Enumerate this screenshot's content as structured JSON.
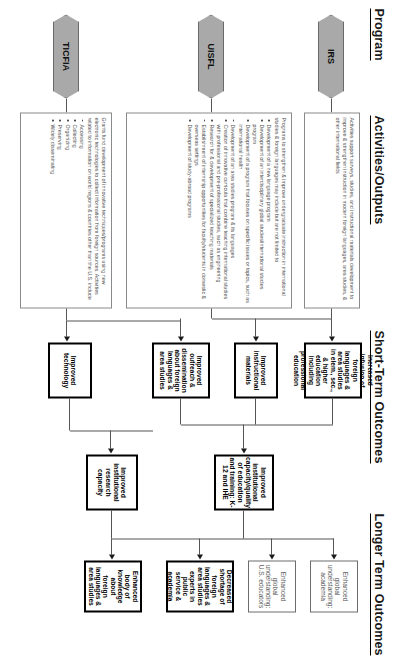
{
  "diagram": {
    "rotation_degrees": 90,
    "columns": [
      {
        "id": "program",
        "label": "Program"
      },
      {
        "id": "activities",
        "label": "Activities/Outputs"
      },
      {
        "id": "short_term",
        "label": "Short-Term Outcomes"
      },
      {
        "id": "long_term",
        "label": "Longer Term Outcomes"
      }
    ]
  },
  "programs": [
    {
      "id": "irs",
      "label": "IRS"
    },
    {
      "id": "uisfl",
      "label": "UISFL"
    },
    {
      "id": "ticfia",
      "label": "TICFIA"
    }
  ],
  "activities": [
    {
      "id": "irs-activities",
      "intro": "Activities support surveys, studies, and instructional materials development to improve & strengthen instruction in modern foreign languages, area studies, & other international fields",
      "bullets": []
    },
    {
      "id": "uisfl-activities",
      "intro": "Programs to strengthen & improve undergraduate instruction in international studies & foreign languages may include but are not limited to",
      "bullets": [
        "Development of a new language program",
        "Development of an interdisciplinary global studies/international studies program",
        "Development of a program that focuses on specific issues or topics, such as international health",
        "Development of an area studies program & its languages",
        "Creation of innovative curricula that combine teaching international studies with professional and pre-professional studies, such as engineering",
        "Research for & development of specialized teaching materials",
        "Establishment of internship opportunities for faculty/students in domestic & overseas settings",
        "Development of study-abroad programs"
      ]
    },
    {
      "id": "ticfia-activities",
      "intro": "Grants fund development of innovative techniques/programs using new electronic technologies to collect information from foreign sources. Activities related to information on world regions & countries other than the U.S. include",
      "bullets": [
        "Accessing",
        "Collecting",
        "Organizing",
        "Preserving",
        "Widely disseminating"
      ]
    }
  ],
  "short_term_outcomes": [
    {
      "id": "st-infusion",
      "label": "Increased infusion of foreign languages & area studies in elem., sec., & higher education including professional education",
      "emphasis": "bold"
    },
    {
      "id": "st-materials",
      "label": "Improved instructional materials",
      "emphasis": "bold"
    },
    {
      "id": "st-outreach",
      "label": "Improved outreach & dissemination about foreign languages & area studies",
      "emphasis": "bold"
    },
    {
      "id": "st-technology",
      "label": "Improved technology",
      "emphasis": "bold"
    }
  ],
  "intermediate_outcomes": [
    {
      "id": "mid-institutional-capacity",
      "label": "Improved institutional capacity/quality of education and training: K-12 and IHE",
      "emphasis": "bold"
    },
    {
      "id": "mid-research-capacity",
      "label": "Improved institutional research capacity",
      "emphasis": "bold"
    }
  ],
  "long_term_outcomes": [
    {
      "id": "lt-global-academia",
      "label": "Enhanced global understanding: academia",
      "emphasis": "thin"
    },
    {
      "id": "lt-global-educators",
      "label": "Enhanced global understanding: U.S. educators",
      "emphasis": "thin"
    },
    {
      "id": "lt-shortage",
      "label": "Decreased shortage of foreign languages & area studies experts in public service & academia",
      "emphasis": "bold"
    },
    {
      "id": "lt-knowledge-body",
      "label": "Enhanced body of knowledge about foreign languages & area studies",
      "emphasis": "bold"
    }
  ],
  "colors": {
    "chevron_fill": "#a9a9a9",
    "bold_border": "#000000",
    "thin_border": "#6d6d6d",
    "text": "#1a1a1a",
    "muted_text": "#4f4f4f",
    "connector": "#555555"
  }
}
